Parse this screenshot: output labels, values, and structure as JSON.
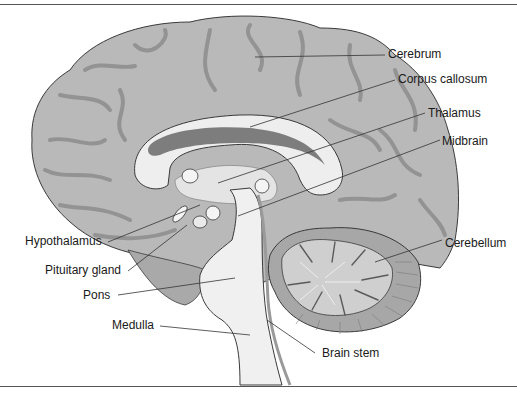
{
  "figure": {
    "labels": {
      "cerebrum": "Cerebrum",
      "corpus_callosum": "Corpus callosum",
      "thalamus": "Thalamus",
      "midbrain": "Midbrain",
      "hypothalamus": "Hypothalamus",
      "cerebellum": "Cerebellum",
      "pituitary_gland": "Pituitary gland",
      "pons": "Pons",
      "medulla": "Medulla",
      "brain_stem": "Brain stem"
    },
    "colors": {
      "cortex": "#b9b9b9",
      "sulcus": "#8f8f8f",
      "outline": "#3a3a3a",
      "white_matter": "#eeeeee",
      "ventricle": "#7d7d7d",
      "cerebellum": "#c4c4c4",
      "stem": "#f0f0f0",
      "rule": "#555555"
    }
  }
}
